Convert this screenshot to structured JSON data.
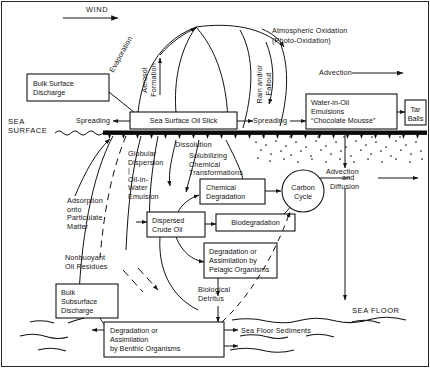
{
  "diagram": {
    "title_free_labels": {
      "wind": "WIND",
      "evaporation": "Evaporation",
      "aerosol_formation": "Aerosol\nFormation",
      "rain_and_or_fallout": "Rain and/or\nFallout",
      "atmospheric_oxidation_l1": "Atmospheric Oxidation",
      "atmospheric_oxidation_l2": "(Photo-Oxidation)",
      "advection_top": "Advection",
      "spreading_left": "Spreading",
      "spreading_right": "Spreading",
      "sea_surface": "SEA\nSURFACE",
      "dissolution": "Dissolution",
      "globular_dispersion": "Globular\nDispersion\n|\nOil-in-\nWater\nEmulsion",
      "solubilizing": "Solubilizing\nChemical\nTransformations",
      "adsorption": "Adsorption\nonto\nParticulate\nMatter",
      "nonbuoyant": "Nonbuoyant\nOil Residues",
      "advection_diffusion_l1": "Advection",
      "advection_diffusion_l2": "and",
      "advection_diffusion_l3": "Diffusion",
      "biological_detritus": "Biological\nDetritus",
      "sea_floor_sediments": "Sea Floor Sediments",
      "sea_floor": "SEA FLOOR"
    },
    "boxes": [
      {
        "id": "bulk-surface-discharge",
        "lines": [
          "Bulk Surface",
          "Discharge"
        ]
      },
      {
        "id": "sea-surface-oil-slick",
        "lines": [
          "Sea Surface Oil Slick"
        ]
      },
      {
        "id": "water-in-oil-emulsions",
        "lines": [
          "Water-in-Oil",
          "Emulsions",
          "“Chocolate Mousse”"
        ]
      },
      {
        "id": "tar-balls",
        "lines": [
          "Tar",
          "Balls"
        ]
      },
      {
        "id": "chemical-degradation",
        "lines": [
          "Chemical",
          "Degradation"
        ]
      },
      {
        "id": "dispersed-crude-oil",
        "lines": [
          "Dispersed",
          "Crude Oil"
        ]
      },
      {
        "id": "biodegradation",
        "lines": [
          "Biodegradation"
        ]
      },
      {
        "id": "degradation-pelagic",
        "lines": [
          "Degradation or",
          "Assimilation by",
          "Pelagic Organisms"
        ]
      },
      {
        "id": "bulk-subsurface-discharge",
        "lines": [
          "Bulk",
          "Subsurface",
          "Discharge"
        ]
      },
      {
        "id": "degradation-benthic",
        "lines": [
          "Degradation or",
          "Assimilation",
          "by Benthic Organisms"
        ]
      }
    ],
    "circle": {
      "id": "carbon-cycle",
      "lines": [
        "Carbon",
        "Cycle"
      ]
    },
    "colors": {
      "ink": "#141414",
      "paper": "#ffffff",
      "slick_band": "#0a0a0a"
    }
  }
}
